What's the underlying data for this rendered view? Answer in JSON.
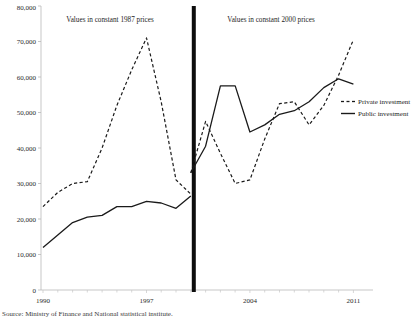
{
  "figure": {
    "caption": "Source: Ministry of Finance and National statistical institute."
  },
  "chart_data": {
    "type": "line",
    "title": "",
    "xlabel": "",
    "ylabel": "",
    "xlim": [
      1990,
      2011
    ],
    "ylim": [
      0,
      80000
    ],
    "xticks": [
      1990,
      1997,
      2004,
      2011
    ],
    "yticks": [
      0,
      10000,
      20000,
      30000,
      40000,
      50000,
      60000,
      70000,
      80000
    ],
    "ytick_labels": [
      "0",
      "10,000",
      "20,000",
      "30,000",
      "40,000",
      "50,000",
      "60,000",
      "70,000",
      "80,000"
    ],
    "xtick_labels": [
      "1990",
      "1997",
      "2004",
      "2011"
    ],
    "grid": false,
    "legend_position": "right-middle",
    "annotations": [
      {
        "name": "left-panel-title",
        "text": "Values in constant 1987 prices",
        "x": 1995.0,
        "y": 76500
      },
      {
        "name": "right-panel-title",
        "text": "Values in constant 2000 prices",
        "x": 2004.0,
        "y": 76500
      },
      {
        "name": "break-line",
        "text": "",
        "x": 2000.2,
        "y": 0
      }
    ],
    "series": [
      {
        "name": "Private investment",
        "style": "dashed",
        "color": "#1a1a1a",
        "segments": [
          {
            "panel": "constant 1987 prices",
            "x": [
              1990,
              1991,
              1992,
              1993,
              1994,
              1995,
              1996,
              1997,
              1998,
              1999,
              2000
            ],
            "values": [
              23500,
              27500,
              30000,
              30500,
              40000,
              52000,
              62000,
              71000,
              53000,
              31000,
              27000
            ]
          },
          {
            "panel": "constant 2000 prices",
            "x": [
              2000,
              2001,
              2002,
              2003,
              2004,
              2005,
              2006,
              2007,
              2008,
              2009,
              2010,
              2011
            ],
            "values": [
              33000,
              47500,
              38500,
              30000,
              31000,
              42500,
              52500,
              53000,
              46500,
              52000,
              60500,
              70500
            ]
          }
        ]
      },
      {
        "name": "Public investment",
        "style": "solid",
        "color": "#1a1a1a",
        "segments": [
          {
            "panel": "constant 1987 prices",
            "x": [
              1990,
              1991,
              1992,
              1993,
              1994,
              1995,
              1996,
              1997,
              1998,
              1999,
              2000
            ],
            "values": [
              12000,
              15500,
              19000,
              20500,
              21000,
              23500,
              23500,
              25000,
              24500,
              23000,
              26500
            ]
          },
          {
            "panel": "constant 2000 prices",
            "x": [
              2000,
              2001,
              2002,
              2003,
              2004,
              2005,
              2006,
              2007,
              2008,
              2009,
              2010,
              2011
            ],
            "values": [
              33000,
              40500,
              57500,
              57500,
              44500,
              46500,
              49500,
              50500,
              53000,
              57000,
              59500,
              58000
            ]
          }
        ]
      }
    ],
    "legend": [
      {
        "label": "Private investment",
        "style": "dashed"
      },
      {
        "label": "Public investment",
        "style": "solid"
      }
    ]
  }
}
